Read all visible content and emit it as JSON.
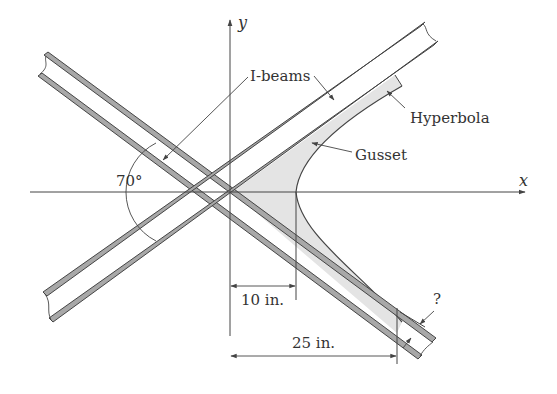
{
  "figure": {
    "colors": {
      "line": "#444444",
      "beam_fill": "#a8a8a8",
      "gusset_fill": "#e4e4e4",
      "text": "#333333",
      "background": "#ffffff"
    },
    "axes": {
      "x_label": "x",
      "y_label": "y"
    },
    "labels": {
      "ibeams": "I-beams",
      "hyperbola": "Hyperbola",
      "gusset": "Gusset",
      "angle": "70°",
      "dim_vertex": "10 in.",
      "dim_end": "25 in.",
      "unknown": "?"
    },
    "dimensions": {
      "vertex_distance_in": 10,
      "gusset_end_distance_in": 25,
      "angle_between_beams_deg": 70
    }
  }
}
